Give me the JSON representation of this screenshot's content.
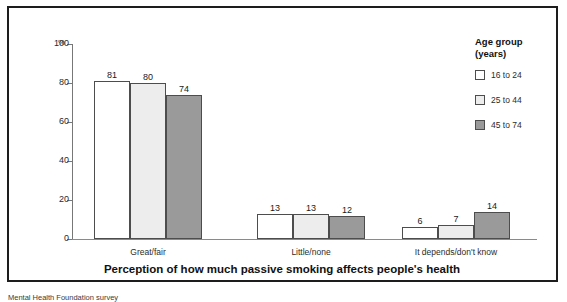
{
  "chart_data": {
    "type": "bar",
    "title": "",
    "xlabel": "Perception of how much passive smoking affects people's health",
    "ylabel": "%",
    "ylim": [
      0,
      100
    ],
    "yticks": [
      0,
      20,
      40,
      60,
      80,
      100
    ],
    "grid": false,
    "legend_position": "right",
    "legend_title_line1": "Age group",
    "legend_title_line2": "(years)",
    "categories": [
      "Great/fair",
      "Little/none",
      "It depends/don't know"
    ],
    "series": [
      {
        "name": "16 to 24",
        "color": "#ffffff",
        "values": [
          81,
          13,
          6
        ]
      },
      {
        "name": "25 to 44",
        "color": "#ededed",
        "values": [
          80,
          13,
          7
        ]
      },
      {
        "name": "45 to 74",
        "color": "#9a9a9a",
        "values": [
          74,
          12,
          14
        ]
      }
    ]
  },
  "footnote": {
    "text": "Mental Health Foundation survey"
  }
}
